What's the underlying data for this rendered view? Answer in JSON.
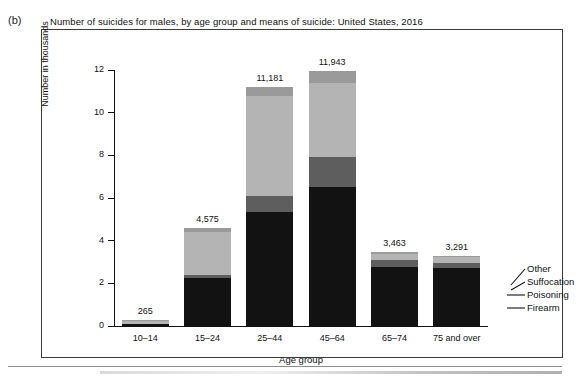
{
  "figure": {
    "panel_label": "(b)",
    "title": "Number of suicides for males, by age group and means of suicide: United States, 2016"
  },
  "axes": {
    "y_title": "Number in thousands",
    "x_title": "Age group",
    "y_ticks": [
      "0",
      "2",
      "4",
      "6",
      "8",
      "10",
      "12"
    ]
  },
  "legend": {
    "items": [
      {
        "label": "Other",
        "color": "#9a9a9a"
      },
      {
        "label": "Suffocation",
        "color": "#b4b4b4"
      },
      {
        "label": "Poisoning",
        "color": "#5e5e5e"
      },
      {
        "label": "Firearm",
        "color": "#121212"
      }
    ]
  },
  "chart_data": {
    "type": "bar",
    "subtype": "stacked",
    "title": "Number of suicides for males, by age group and means of suicide: United States, 2016",
    "xlabel": "Age group",
    "ylabel": "Number in thousands",
    "ylim": [
      0,
      12
    ],
    "yticks": [
      0,
      2,
      4,
      6,
      8,
      10,
      12
    ],
    "grid": false,
    "legend_position": "right-leader-lines",
    "units": "thousands",
    "categories": [
      "10–14",
      "15–24",
      "25–44",
      "45–64",
      "65–74",
      "75 and over"
    ],
    "totals": [
      265,
      4575,
      11181,
      11943,
      3463,
      3291
    ],
    "total_labels": [
      "265",
      "4,575",
      "11,181",
      "11,943",
      "3,463",
      "3,291"
    ],
    "series": [
      {
        "name": "Firearm",
        "color": "#121212",
        "values": [
          90,
          2250,
          5350,
          6500,
          2750,
          2700
        ]
      },
      {
        "name": "Poisoning",
        "color": "#5e5e5e",
        "values": [
          15,
          150,
          750,
          1400,
          330,
          250
        ]
      },
      {
        "name": "Suffocation",
        "color": "#b4b4b4",
        "values": [
          150,
          2000,
          4700,
          3500,
          300,
          270
        ]
      },
      {
        "name": "Other",
        "color": "#9a9a9a",
        "values": [
          10,
          175,
          381,
          543,
          83,
          71
        ]
      }
    ]
  }
}
